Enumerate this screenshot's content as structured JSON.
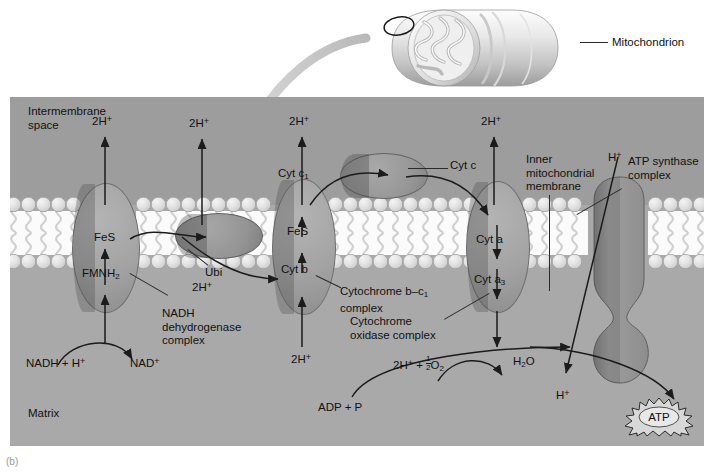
{
  "figure": {
    "caption": "(b)",
    "organelle_label": "Mitochondrion"
  },
  "compartments": {
    "intermembrane_space": "Intermembrane\nspace",
    "intermembrane_line1": "Intermembrane",
    "intermembrane_line2": "space",
    "matrix": "Matrix"
  },
  "membrane": {
    "label_line1": "Inner",
    "label_line2": "mitochondrial",
    "label_line3": "membrane"
  },
  "complexes": [
    {
      "id": "nadh-dehydrogenase",
      "line1": "NADH",
      "line2": "dehydrogenase",
      "line3": "complex"
    },
    {
      "id": "cytochrome-bc1",
      "line1_pre": "Cytochrome ",
      "line1_it": "b–c",
      "line1_sub": "1",
      "line2": "complex"
    },
    {
      "id": "cytochrome-oxidase",
      "line1": "Cytochrome",
      "line2": "oxidase complex"
    },
    {
      "id": "atp-synthase",
      "line1": "ATP synthase",
      "line2": "complex"
    }
  ],
  "carriers": {
    "fes_complex1": "FeS",
    "fmnh2_pre": "FMNH",
    "fmnh2_sub": "2",
    "ubiquinone": "Ubi",
    "cyt_b_pre": "Cyt ",
    "cyt_b_it": "b",
    "fes_complex3": "FeS",
    "cyt_c1_pre": "Cyt ",
    "cyt_c1_it": "c",
    "cyt_c1_sub": "1",
    "cyt_c_pre": "Cyt ",
    "cyt_c_it": "c",
    "cyt_a_pre": "Cyt ",
    "cyt_a_it": "a",
    "cyt_a3_pre": "Cyt ",
    "cyt_a3_it": "a",
    "cyt_a3_sub": "3"
  },
  "protons": {
    "pumped_top": [
      "2H",
      "2H",
      "2H",
      "2H"
    ],
    "pumped_sup": "+",
    "matrix_source": [
      "2H",
      "2H"
    ],
    "synthase_in": "H",
    "synthase_out": "H"
  },
  "reactions": {
    "nadh_substrate_pre": "NADH + H",
    "nadh_substrate_sup": "+",
    "nad_product": "NAD",
    "nad_product_sup": "+",
    "oxygen_pre": "2H",
    "oxygen_sup": "+",
    "oxygen_mid": " + ",
    "oxygen_frac_num": "1",
    "oxygen_frac_den": "2",
    "oxygen_post_pre": "O",
    "oxygen_post_sub": "2",
    "water_pre": "H",
    "water_sub": "2",
    "water_post": "O",
    "adp": "ADP + P",
    "atp": "ATP"
  },
  "colors": {
    "panel_bg": "#a9a9a9",
    "ims_bg": "#9d9d9d",
    "complex_fill": "#a2a2a2",
    "lipid_head": "#e2e2e2",
    "lipid_tail_bg": "#fbfbfb",
    "ink": "#1d1d1d",
    "inset_arrow": "#c9c9c9"
  }
}
